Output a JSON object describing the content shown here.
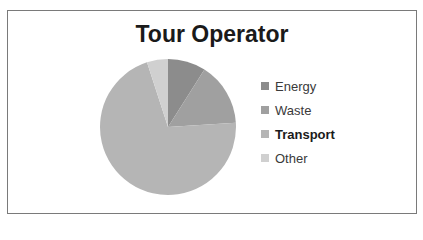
{
  "chart_data": {
    "type": "pie",
    "title": "Tour Operator",
    "categories": [
      "Energy",
      "Waste",
      "Transport",
      "Other"
    ],
    "values": [
      9,
      15,
      71,
      5
    ],
    "colors": [
      "#8c8c8c",
      "#a0a0a0",
      "#b5b5b5",
      "#d0d0d0"
    ],
    "start_angle": "top, clockwise",
    "legend_position": "right"
  },
  "legend": {
    "items": [
      {
        "label": "Energy",
        "color": "#8c8c8c",
        "bold": false
      },
      {
        "label": "Waste",
        "color": "#a0a0a0",
        "bold": false
      },
      {
        "label": "Transport",
        "color": "#b5b5b5",
        "bold": true
      },
      {
        "label": "Other",
        "color": "#d0d0d0",
        "bold": false
      }
    ]
  }
}
